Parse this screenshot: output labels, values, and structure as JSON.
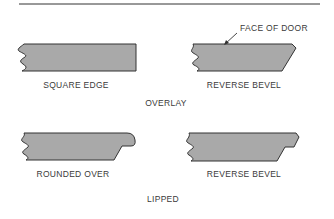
{
  "diagram": {
    "callout": "FACE OF DOOR",
    "groups": [
      {
        "label": "OVERLAY",
        "profiles": [
          {
            "label": "SQUARE EDGE"
          },
          {
            "label": "REVERSE BEVEL"
          }
        ]
      },
      {
        "label": "LIPPED",
        "profiles": [
          {
            "label": "ROUNDED OVER"
          },
          {
            "label": "REVERSE BEVEL"
          }
        ]
      }
    ],
    "colors": {
      "fill": "#a9a9a9",
      "stroke": "#333333",
      "text": "#3a3a3a"
    }
  }
}
